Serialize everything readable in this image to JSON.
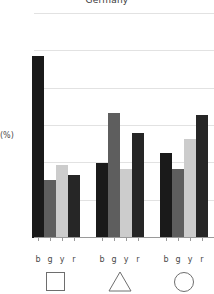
{
  "chart_data": {
    "type": "bar",
    "title": "Germany",
    "xlabel": "",
    "ylabel": "(%)",
    "ylim": [
      0,
      60
    ],
    "yticks": [
      0,
      10,
      20,
      30,
      40,
      50,
      60
    ],
    "ytick_labels": [
      "0",
      "10",
      "20",
      "30",
      "40",
      "50",
      "60"
    ],
    "grid": true,
    "legend": "none",
    "categories": [
      "b",
      "g",
      "y",
      "r"
    ],
    "groups": [
      {
        "name": "square",
        "symbol": "square",
        "bars": [
          {
            "label": "b",
            "value": 48.8,
            "color": "#1a1a1a"
          },
          {
            "label": "g",
            "value": 15.6,
            "color": "#5e5e5e"
          },
          {
            "label": "y",
            "value": 19.6,
            "color": "#cccccc"
          },
          {
            "label": "r",
            "value": 16.8,
            "color": "#262626"
          }
        ]
      },
      {
        "name": "triangle",
        "symbol": "triangle",
        "bars": [
          {
            "label": "b",
            "value": 20.2,
            "color": "#1a1a1a"
          },
          {
            "label": "g",
            "value": 33.6,
            "color": "#5e5e5e"
          },
          {
            "label": "y",
            "value": 18.5,
            "color": "#cccccc"
          },
          {
            "label": "r",
            "value": 28.2,
            "color": "#262626"
          }
        ]
      },
      {
        "name": "circle",
        "symbol": "circle",
        "bars": [
          {
            "label": "b",
            "value": 22.8,
            "color": "#1a1a1a"
          },
          {
            "label": "g",
            "value": 18.5,
            "color": "#5e5e5e"
          },
          {
            "label": "y",
            "value": 26.5,
            "color": "#cccccc"
          },
          {
            "label": "r",
            "value": 33.0,
            "color": "#262626"
          }
        ]
      }
    ]
  }
}
